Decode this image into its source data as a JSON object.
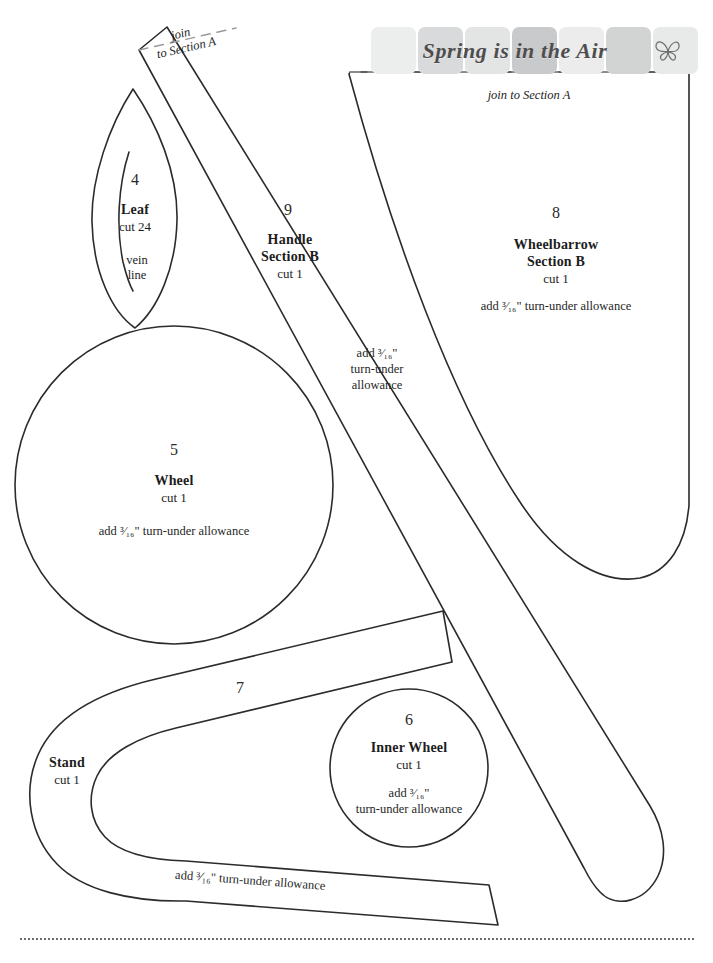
{
  "page": {
    "title": "Spring is in the Air",
    "width": 713,
    "height": 963,
    "background": "#ffffff",
    "ink": "#1d1d1d"
  },
  "banner": {
    "title": "Spring is in the Air",
    "butterfly_icon": "butterfly-icon",
    "square_colors": [
      "#eceded",
      "#d9dadb",
      "#e3e4e4",
      "#c9cacb",
      "#ececec",
      "#d2d3d3",
      "#e8e9e9"
    ]
  },
  "join_labels": {
    "section_b_top": "join to Section A",
    "handle_top_line1": "join",
    "handle_top_line2": "to Section A"
  },
  "pieces": [
    {
      "id": "leaf",
      "number": "4",
      "name": "Leaf",
      "cut": "cut 24",
      "note_line1": "vein",
      "note_line2": "line",
      "allowance": ""
    },
    {
      "id": "handle-section-b",
      "number": "9",
      "name_line1": "Handle",
      "name_line2": "Section B",
      "cut": "cut 1",
      "allowance_line1": "add ³⁄₁₆\"",
      "allowance_line2": "turn-under",
      "allowance_line3": "allowance"
    },
    {
      "id": "wheelbarrow-section-b",
      "number": "8",
      "name_line1": "Wheelbarrow",
      "name_line2": "Section B",
      "cut": "cut 1",
      "allowance": "add ³⁄₁₆\" turn-under allowance"
    },
    {
      "id": "wheel",
      "number": "5",
      "name": "Wheel",
      "cut": "cut 1",
      "allowance": "add ³⁄₁₆\" turn-under allowance"
    },
    {
      "id": "inner-wheel",
      "number": "6",
      "name": "Inner Wheel",
      "cut": "cut 1",
      "allowance_line1": "add ³⁄₁₆\"",
      "allowance_line2": "turn-under allowance"
    },
    {
      "id": "stand",
      "number": "7",
      "name": "Stand",
      "cut": "cut 1",
      "allowance": "add ³⁄₁₆\" turn-under allowance"
    }
  ]
}
